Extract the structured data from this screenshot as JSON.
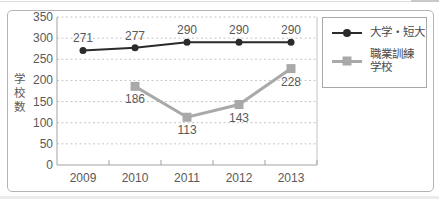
{
  "chart_data": {
    "type": "line",
    "title": "",
    "categories": [
      "2009",
      "2010",
      "2011",
      "2012",
      "2013"
    ],
    "series": [
      {
        "name": "大学・短大",
        "values": [
          271,
          277,
          290,
          290,
          290
        ],
        "color": "#2b2b2b",
        "marker": "circle",
        "marker_size": 7,
        "line_width": 2,
        "label_position": "above"
      },
      {
        "name": "職業訓練学校",
        "values": [
          null,
          186,
          113,
          143,
          228
        ],
        "color": "#a9a9a9",
        "marker": "square",
        "marker_size": 9,
        "line_width": 3,
        "label_position": "below"
      }
    ],
    "xlabel": "",
    "ylabel": "学校数",
    "ylim": [
      0,
      350
    ],
    "yticks": [
      0,
      50,
      100,
      150,
      200,
      250,
      300,
      350
    ],
    "grid": "horizontal-dotted",
    "legend_position": "right-inside-frame"
  },
  "legend": {
    "items": [
      {
        "label": "大学・短大",
        "color": "#2b2b2b",
        "marker": "line-circle"
      },
      {
        "label_line1": "職業訓練",
        "label_line2": "学校",
        "color": "#a9a9a9",
        "marker": "line-square"
      }
    ]
  },
  "colors": {
    "series_univ": "#2b2b2b",
    "series_vocational": "#a9a9a9",
    "grid": "#c6c6c6",
    "axis": "#a3a3a3",
    "text": "#595959",
    "frame_border": "#b4b4b4",
    "legend_border": "#a8a8a8"
  }
}
